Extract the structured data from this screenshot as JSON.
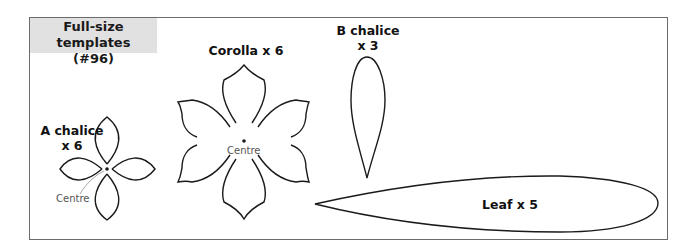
{
  "title": {
    "line1": "Full-size templates",
    "line2": "(#96)"
  },
  "templates": [
    {
      "id": "a-chalice",
      "label_line1": "A chalice",
      "label_line2": "x 6",
      "centre_label": "Centre"
    },
    {
      "id": "corolla",
      "label_line1": "Corolla x 6",
      "centre_label": "Centre"
    },
    {
      "id": "b-chalice",
      "label_line1": "B chalice",
      "label_line2": "x 3"
    },
    {
      "id": "leaf",
      "label_line1": "Leaf x 5"
    }
  ],
  "colors": {
    "outline": "#1a1a1a",
    "frame": "#6b6b6b",
    "title_bg": "#e1e1e1",
    "leader_line": "#9a9a9a"
  }
}
